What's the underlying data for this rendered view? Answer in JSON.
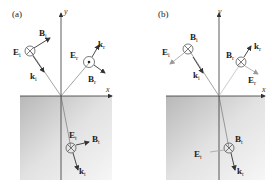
{
  "panels": [
    {
      "label": "(a)",
      "axis_x": "x",
      "axis_y": "y",
      "incident": {
        "E": "E",
        "E_sub": "i",
        "B": "B",
        "B_sub": "i",
        "k": "k",
        "k_sub": "i",
        "E_symbol": "into-page"
      },
      "reflected": {
        "E": "E",
        "E_sub": "r",
        "B": "B",
        "B_sub": "r",
        "k": "k",
        "k_sub": "r",
        "E_symbol": "out-of-page"
      },
      "transmitted": {
        "E": "E",
        "E_sub": "t",
        "B": "B",
        "B_sub": "t",
        "k": "k",
        "k_sub": "t",
        "E_symbol": "into-page"
      }
    },
    {
      "label": "(b)",
      "axis_x": "x",
      "axis_y": "y",
      "incident": {
        "E": "E",
        "E_sub": "i",
        "B": "B",
        "B_sub": "i",
        "k": "k",
        "k_sub": "i",
        "B_symbol": "into-page"
      },
      "reflected": {
        "E": "E",
        "E_sub": "r",
        "B": "B",
        "B_sub": "r",
        "k": "k",
        "k_sub": "r",
        "B_symbol": "into-page"
      },
      "transmitted": {
        "E": "E",
        "E_sub": "t",
        "B": "B",
        "B_sub": "t",
        "k": "k",
        "k_sub": "t",
        "B_symbol": "into-page"
      }
    }
  ],
  "colors": {
    "medium_gray": "#c8c8c8",
    "line": "#333333"
  }
}
